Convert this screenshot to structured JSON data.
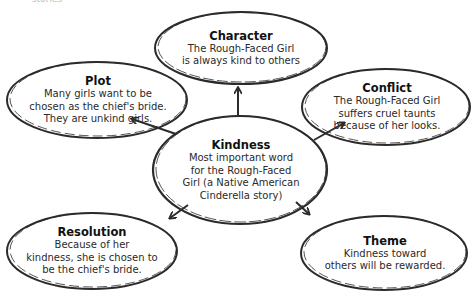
{
  "diagram": {
    "type": "story-web",
    "top_cut_text": "stories",
    "center": {
      "title": "Kindness",
      "body": "Most important word\nfor the Rough-Faced\nGirl (a Native American\nCinderella story)"
    },
    "nodes": [
      {
        "id": "character",
        "title": "Character",
        "body": "The Rough-Faced Girl\nis always kind to others"
      },
      {
        "id": "plot",
        "title": "Plot",
        "body": "Many girls want to be\nchosen as the chief's bride.\nThey are unkind girls."
      },
      {
        "id": "conflict",
        "title": "Conflict",
        "body": "The Rough-Faced Girl\nsuffers cruel taunts\nbecause of her looks."
      },
      {
        "id": "resolution",
        "title": "Resolution",
        "body": "Because of her\nkindness, she is chosen to\nbe the chief's bride."
      },
      {
        "id": "theme",
        "title": "Theme",
        "body": "Kindness toward\nothers will be rewarded."
      }
    ],
    "edges": [
      {
        "from": "center",
        "to": "character"
      },
      {
        "from": "center",
        "to": "plot"
      },
      {
        "from": "center",
        "to": "conflict"
      },
      {
        "from": "center",
        "to": "resolution"
      },
      {
        "from": "center",
        "to": "theme"
      }
    ],
    "colors": {
      "stroke": "#2b2b2b",
      "background": "#ffffff",
      "text": "#222222"
    }
  }
}
